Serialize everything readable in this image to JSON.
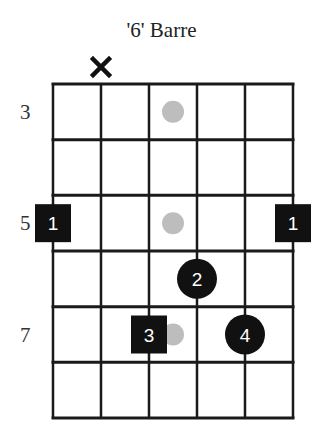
{
  "title": "'6' Barre",
  "grid": {
    "strings": 6,
    "rows": 6,
    "left": 53,
    "right": 293,
    "top": 84,
    "bottom": 418,
    "line_color": "#1a1a1a"
  },
  "fret_labels": [
    {
      "row": 1,
      "text": "3"
    },
    {
      "row": 3,
      "text": "5"
    },
    {
      "row": 5,
      "text": "7"
    }
  ],
  "muted_strings": [
    2
  ],
  "inlay_dots": [
    {
      "row": 1,
      "cell": 3,
      "color": "#bdbdbd"
    },
    {
      "row": 3,
      "cell": 3,
      "color": "#bdbdbd"
    },
    {
      "row": 5,
      "cell": 3,
      "color": "#bdbdbd"
    }
  ],
  "fingers": [
    {
      "string": 1,
      "row": 3,
      "finger": "1",
      "shape": "square"
    },
    {
      "string": 6,
      "row": 3,
      "finger": "1",
      "shape": "square"
    },
    {
      "string": 4,
      "row": 4,
      "finger": "2",
      "shape": "circle"
    },
    {
      "string": 3,
      "row": 5,
      "finger": "3",
      "shape": "square"
    },
    {
      "string": 5,
      "row": 5,
      "finger": "4",
      "shape": "circle"
    }
  ],
  "marker_color": "#111111"
}
